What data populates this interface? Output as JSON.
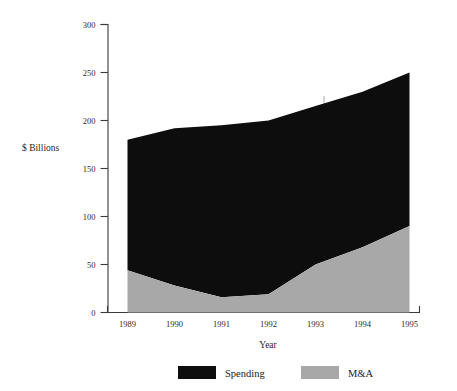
{
  "chart_data": {
    "type": "area",
    "stacked": true,
    "title": "",
    "xlabel": "Year",
    "ylabel": "$ Billions",
    "categories": [
      "1989",
      "1990",
      "1991",
      "1992",
      "1993",
      "1994",
      "1995"
    ],
    "x": [
      1989,
      1990,
      1991,
      1992,
      1993,
      1994,
      1995
    ],
    "series": [
      {
        "name": "M&A",
        "color": "#a8a8a8",
        "values": [
          44,
          28,
          16,
          19,
          50,
          68,
          90
        ]
      },
      {
        "name": "Spending",
        "color": "#0d0d0d",
        "values": [
          136,
          164,
          179,
          181,
          165,
          162,
          160
        ]
      }
    ],
    "totals": [
      180,
      192,
      195,
      200,
      215,
      230,
      250
    ],
    "ylim": [
      0,
      300
    ],
    "yticks": [
      "0",
      "50",
      "100",
      "150",
      "200",
      "250",
      "300"
    ],
    "ytick_values": [
      0,
      50,
      100,
      150,
      200,
      250,
      300
    ],
    "grid": false,
    "legend_position": "bottom"
  },
  "axis": {
    "y_title": "$ Billions",
    "x_title": "Year"
  },
  "legend": {
    "items": [
      {
        "label": "Spending",
        "swatch": "#0d0d0d"
      },
      {
        "label": "M&A",
        "swatch": "#a8a8a8"
      }
    ]
  }
}
